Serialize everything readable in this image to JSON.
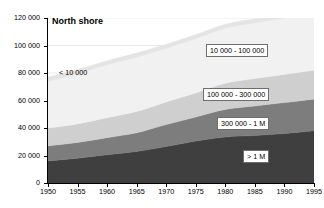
{
  "chart_data": {
    "type": "area",
    "title": "North shore",
    "xlabel": "",
    "ylabel": "",
    "x": [
      1950,
      1955,
      1960,
      1965,
      1970,
      1975,
      1980,
      1985,
      1990,
      1995
    ],
    "xlim": [
      1950,
      1995
    ],
    "ylim": [
      0,
      120000
    ],
    "yticks": [
      0,
      20000,
      40000,
      60000,
      80000,
      100000,
      120000
    ],
    "ytick_labels": [
      "0",
      "20 000",
      "40 000",
      "60 000",
      "80 000",
      "100 000",
      "120 000"
    ],
    "xticks": [
      1950,
      1955,
      1960,
      1965,
      1970,
      1975,
      1980,
      1985,
      1990,
      1995
    ],
    "xtick_labels": [
      "1950",
      "1955",
      "1960",
      "1965",
      "1970",
      "1975",
      "1980",
      "1985",
      "1990",
      "1995"
    ],
    "grid": true,
    "stacked": true,
    "legend_position": "inline-annotations",
    "series": [
      {
        "name": "> 1 M",
        "color": "#3f3f3f",
        "label_text": "> 1 M",
        "values": [
          16000,
          18000,
          20500,
          23000,
          26500,
          30500,
          33500,
          34500,
          36000,
          38000
        ]
      },
      {
        "name": "300 000 - 1 M",
        "color": "#7d7d7d",
        "label_text": "300 000 - 1 M",
        "values": [
          11000,
          11500,
          12500,
          13500,
          16000,
          17500,
          20000,
          21500,
          22500,
          23000
        ]
      },
      {
        "name": "100 000 - 300 000",
        "color": "#cfcfcf",
        "label_text": "100 000 - 300 000",
        "values": [
          13000,
          13500,
          14500,
          15500,
          16500,
          17500,
          19000,
          20000,
          20500,
          21000
        ]
      },
      {
        "name": "< 10 000",
        "color": "#f1f1f1",
        "label_text": "< 10 000",
        "values": [
          34000,
          36500,
          38500,
          39500,
          39000,
          39500,
          40000,
          40500,
          41000,
          41000
        ]
      },
      {
        "name": "10 000 - 100 000",
        "color": "#e4e4e4",
        "label_text": "10 000 - 100 000",
        "values": [
          3000,
          3000,
          3000,
          3000,
          3000,
          3000,
          3000,
          3000,
          3000,
          3000
        ]
      }
    ],
    "cumulative_totals": [
      77000,
      82500,
      89000,
      94500,
      101000,
      108000,
      115500,
      119500,
      123000,
      126000
    ],
    "annotations": [
      {
        "text": "10 000 - 100 000",
        "boxed": true,
        "left": 206,
        "top": 44
      },
      {
        "text": "100 000 - 300 000",
        "boxed": true,
        "left": 203,
        "top": 88
      },
      {
        "text": "300 000 - 1 M",
        "boxed": true,
        "left": 217,
        "top": 117
      },
      {
        "text": "< 10 000",
        "boxed": false,
        "left": 56,
        "top": 67
      },
      {
        "text": "> 1 M",
        "boxed": true,
        "left": 243,
        "top": 150
      }
    ]
  }
}
